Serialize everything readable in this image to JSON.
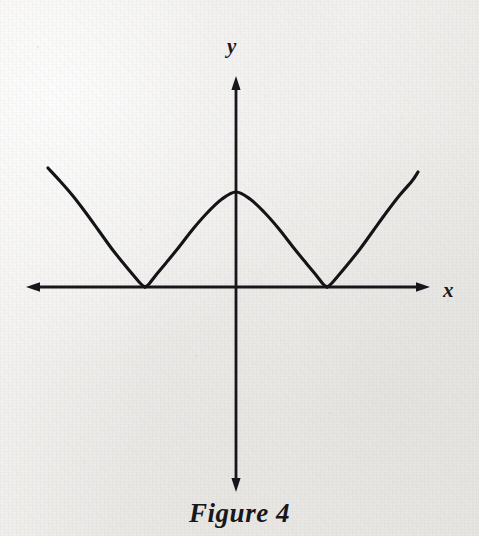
{
  "figure": {
    "caption": "Figure 4",
    "axis_labels": {
      "x": "x",
      "y": "y"
    },
    "ink_color": "#17161a",
    "paper_color": "#f1f0ee"
  },
  "chart_data": {
    "type": "line",
    "title": "Figure 4",
    "xlabel": "x",
    "ylabel": "y",
    "grid": false,
    "legend": null,
    "curve": "cycloid",
    "parametric": {
      "x": "a(t - sin t)",
      "y": "a(1 - cos t)"
    },
    "origin_px": [
      236,
      287
    ],
    "arch_half_width_px": 91,
    "arch_height_px": 95,
    "cusps_px": [
      [
        145,
        287
      ],
      [
        327,
        287
      ]
    ],
    "apex_px": [
      236,
      192
    ],
    "left_curve_endpoint_px": [
      48,
      168
    ],
    "right_curve_endpoint_px": [
      418,
      172
    ],
    "axes": {
      "x_axis_px": {
        "y": 287,
        "from_x": 28,
        "to_x": 428,
        "arrows": [
          "left",
          "right"
        ]
      },
      "y_axis_px": {
        "x": 236,
        "from_y": 78,
        "to_y": 490,
        "arrows": [
          "up",
          "down"
        ]
      }
    },
    "series": [
      {
        "name": "cycloid",
        "points_px": [
          [
            48,
            168
          ],
          [
            60,
            181
          ],
          [
            73,
            196
          ],
          [
            86,
            213
          ],
          [
            99,
            231
          ],
          [
            112,
            249
          ],
          [
            124,
            264
          ],
          [
            134,
            276
          ],
          [
            141,
            284
          ],
          [
            145,
            287
          ],
          [
            149,
            284
          ],
          [
            156,
            275
          ],
          [
            166,
            263
          ],
          [
            179,
            247
          ],
          [
            193,
            229
          ],
          [
            208,
            212
          ],
          [
            222,
            199
          ],
          [
            236,
            192
          ],
          [
            250,
            199
          ],
          [
            264,
            212
          ],
          [
            279,
            229
          ],
          [
            293,
            247
          ],
          [
            306,
            263
          ],
          [
            316,
            275
          ],
          [
            323,
            284
          ],
          [
            327,
            287
          ],
          [
            331,
            284
          ],
          [
            338,
            276
          ],
          [
            348,
            264
          ],
          [
            360,
            249
          ],
          [
            373,
            231
          ],
          [
            386,
            213
          ],
          [
            399,
            196
          ],
          [
            412,
            181
          ],
          [
            418,
            172
          ]
        ]
      }
    ]
  }
}
